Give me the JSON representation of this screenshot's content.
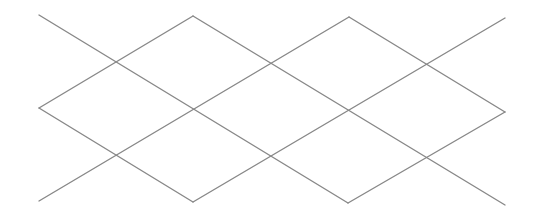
{
  "diagram": {
    "type": "diamond-lattice",
    "background": "#ffffff",
    "stroke_color": "#888888",
    "stroke_width": 1.4,
    "lines": [
      {
        "id": "down-1",
        "x1": 39,
        "y1": 15,
        "x2": 348,
        "y2": 203
      },
      {
        "id": "down-2",
        "x1": 193,
        "y1": 16,
        "x2": 505,
        "y2": 205
      },
      {
        "id": "down-3",
        "x1": 349,
        "y1": 17,
        "x2": 505,
        "y2": 112
      },
      {
        "id": "down-4",
        "x1": 39,
        "y1": 108,
        "x2": 193,
        "y2": 202
      },
      {
        "id": "up-1",
        "x1": 39,
        "y1": 201,
        "x2": 349,
        "y2": 17
      },
      {
        "id": "up-2",
        "x1": 193,
        "y1": 202,
        "x2": 505,
        "y2": 18
      },
      {
        "id": "up-3",
        "x1": 39,
        "y1": 108,
        "x2": 193,
        "y2": 16
      },
      {
        "id": "up-4",
        "x1": 348,
        "y1": 203,
        "x2": 505,
        "y2": 112
      }
    ]
  }
}
